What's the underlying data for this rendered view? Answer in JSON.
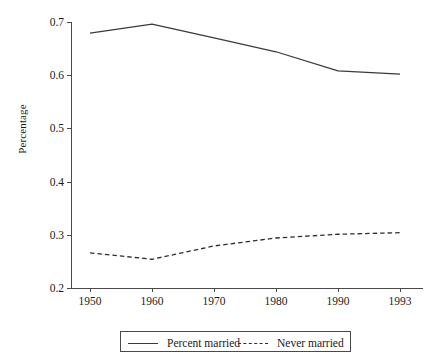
{
  "chart_data": {
    "type": "line",
    "title": "",
    "subtitle": "",
    "xlabel": "",
    "ylabel": "Percentage",
    "categories": [
      "1950",
      "1960",
      "1970",
      "1980",
      "1990",
      "1993"
    ],
    "x_tick_labels": [
      "1950",
      "1960",
      "1970",
      "1980",
      "1990",
      "1993"
    ],
    "y_tick_labels": [
      "0.2",
      "0.3",
      "0.4",
      "0.5",
      "0.6",
      "0.7"
    ],
    "y_tick_values": [
      0.2,
      0.3,
      0.4,
      0.5,
      0.6,
      0.7
    ],
    "ylim": [
      0.2,
      0.7
    ],
    "grid": false,
    "legend_position": "bottom-center",
    "series": [
      {
        "name": "Percent married",
        "style": "solid",
        "color": "#3a3a3a",
        "values": [
          0.679,
          0.696,
          0.67,
          0.644,
          0.608,
          0.602
        ]
      },
      {
        "name": "Never married",
        "style": "dashed",
        "color": "#2e2e2e",
        "values": [
          0.266,
          0.254,
          0.279,
          0.294,
          0.301,
          0.304
        ]
      }
    ],
    "annotations": []
  },
  "legend": {
    "items": [
      {
        "label": "Percent married",
        "style": "solid"
      },
      {
        "label": "Never married",
        "style": "dashed"
      }
    ]
  },
  "axes": {
    "y_axis_label": "Percentage"
  }
}
